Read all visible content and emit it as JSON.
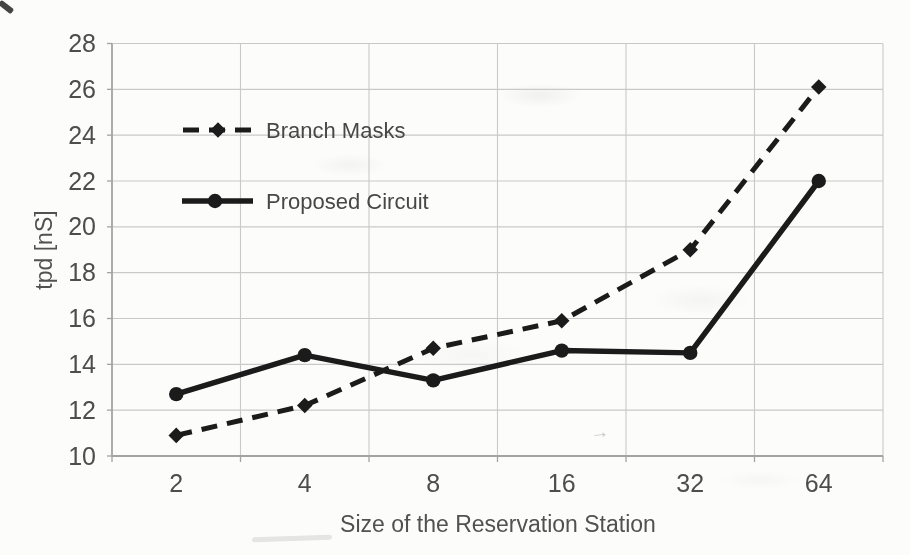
{
  "chart_data": {
    "type": "line",
    "title": "",
    "xlabel": "Size of the Reservation Station",
    "ylabel": "tpd [nS]",
    "categories": [
      "2",
      "4",
      "8",
      "16",
      "32",
      "64"
    ],
    "ylim": [
      10,
      28
    ],
    "yticks": [
      10,
      12,
      14,
      16,
      18,
      20,
      22,
      24,
      26,
      28
    ],
    "grid": true,
    "legend_position": "inside-top-left",
    "series": [
      {
        "name": "Branch Masks",
        "line_style": "dashed",
        "marker": "diamond",
        "color": "#1b1b1b",
        "values": [
          10.9,
          12.2,
          14.7,
          15.9,
          19.0,
          26.1
        ]
      },
      {
        "name": "Proposed Circuit",
        "line_style": "solid",
        "marker": "circle",
        "color": "#1b1b1b",
        "values": [
          12.7,
          14.4,
          13.3,
          14.6,
          14.5,
          22.0
        ]
      }
    ]
  },
  "colors": {
    "background": "#fcfcfa",
    "gridline": "#c9c9c9",
    "axis": "#a3a3a3",
    "text": "#4d4d4d",
    "series": "#1b1b1b"
  }
}
